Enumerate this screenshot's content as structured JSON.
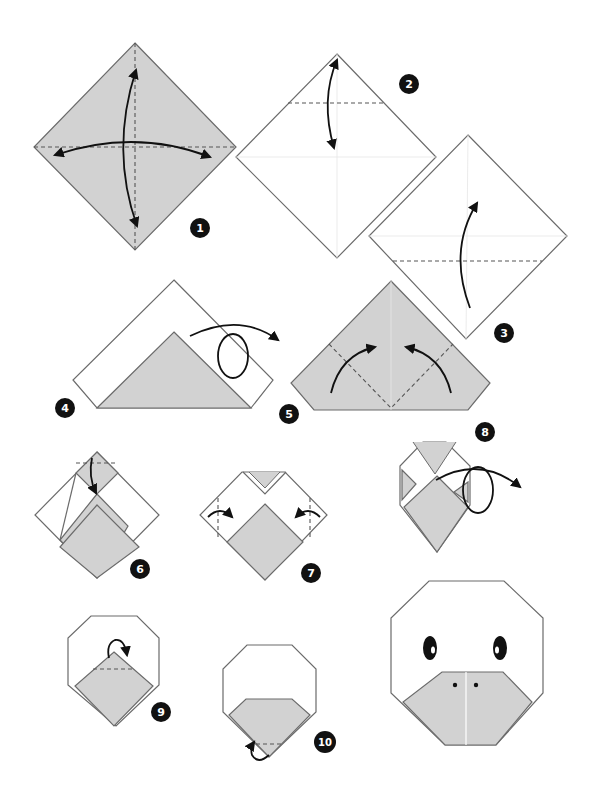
{
  "diagram": {
    "colors": {
      "paper_colored": "#d2d2d2",
      "paper_white": "#ffffff",
      "outline": "#6b6b6b",
      "arrow": "#111111",
      "badge": "#111111"
    },
    "steps": [
      {
        "number": "1",
        "action": "fold and unfold both diagonals"
      },
      {
        "number": "2",
        "action": "fold top corner down to crease and unfold"
      },
      {
        "number": "3",
        "action": "fold bottom corner up"
      },
      {
        "number": "4",
        "action": "turn over"
      },
      {
        "number": "5",
        "action": "fold side corners up"
      },
      {
        "number": "6",
        "action": "fold top flap down"
      },
      {
        "number": "7",
        "action": "fold side corners inward"
      },
      {
        "number": "8",
        "action": "turn over"
      },
      {
        "number": "9",
        "action": "fold tip behind"
      },
      {
        "number": "10",
        "action": "fold bottom tip behind"
      }
    ],
    "final": {
      "label": "duck face",
      "features": [
        "two eyes",
        "beak with two nostrils"
      ]
    }
  }
}
